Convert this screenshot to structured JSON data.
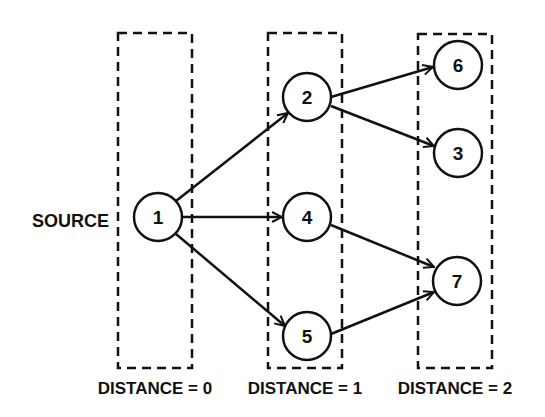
{
  "diagram": {
    "source_label": "SOURCE",
    "layers": [
      {
        "label": "DISTANCE = 0",
        "nodes": [
          "1"
        ]
      },
      {
        "label": "DISTANCE = 1",
        "nodes": [
          "2",
          "4",
          "5"
        ]
      },
      {
        "label": "DISTANCE = 2",
        "nodes": [
          "6",
          "3",
          "7"
        ]
      }
    ],
    "nodes": [
      {
        "id": "1",
        "label": "1"
      },
      {
        "id": "2",
        "label": "2"
      },
      {
        "id": "4",
        "label": "4"
      },
      {
        "id": "5",
        "label": "5"
      },
      {
        "id": "6",
        "label": "6"
      },
      {
        "id": "3",
        "label": "3"
      },
      {
        "id": "7",
        "label": "7"
      }
    ],
    "edges": [
      {
        "from": "1",
        "to": "2"
      },
      {
        "from": "1",
        "to": "4"
      },
      {
        "from": "1",
        "to": "5"
      },
      {
        "from": "2",
        "to": "6"
      },
      {
        "from": "2",
        "to": "3"
      },
      {
        "from": "4",
        "to": "7"
      },
      {
        "from": "5",
        "to": "7"
      }
    ],
    "colors": {
      "stroke": "#111111",
      "background": "#ffffff"
    }
  }
}
